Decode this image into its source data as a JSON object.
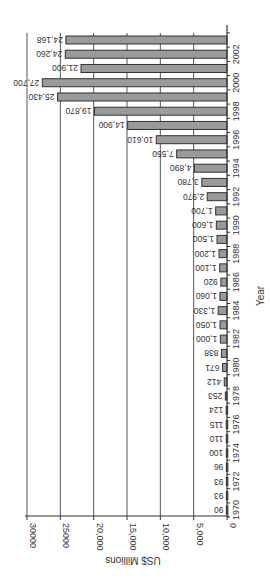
{
  "chart_data": {
    "type": "bar",
    "orientation": "rotated 90 degrees clockwise (horizontal bars growing from right, labels upside-down)",
    "title": "",
    "xlabel": "Year",
    "ylabel": "US$ Millions",
    "ylim": [
      0,
      30000
    ],
    "y_ticks": [
      "0",
      "5,000",
      "10,000",
      "15,000",
      "20,000",
      "25000",
      "30000"
    ],
    "x_tick_labels": [
      "1970",
      "1972",
      "1974",
      "1976",
      "1978",
      "1980",
      "1982",
      "1984",
      "1986",
      "1988",
      "1990",
      "1992",
      "1994",
      "1996",
      "1998",
      "2000",
      "2002"
    ],
    "grid": true,
    "legend": false,
    "categories": [
      1970,
      1971,
      1972,
      1973,
      1974,
      1975,
      1976,
      1977,
      1978,
      1979,
      1980,
      1981,
      1982,
      1983,
      1984,
      1985,
      1986,
      1987,
      1988,
      1989,
      1990,
      1991,
      1992,
      1993,
      1994,
      1995,
      1996,
      1997,
      1998,
      1999,
      2000,
      2001,
      2002,
      2003
    ],
    "values": [
      90,
      93,
      93,
      96,
      100,
      110,
      115,
      124,
      253,
      412,
      671,
      838,
      1000,
      1050,
      1330,
      1060,
      920,
      1100,
      1200,
      1500,
      1600,
      1700,
      2970,
      3780,
      4890,
      7550,
      10610,
      14900,
      19870,
      25430,
      27700,
      21900,
      24260,
      24168
    ],
    "value_labels": [
      "90",
      "93",
      "93",
      "96",
      "100",
      "110",
      "115",
      "124",
      "253",
      "412",
      "671",
      "838",
      "1,000",
      "1,050",
      "1,330",
      "1,060",
      "920",
      "1,100",
      "1,200",
      "1,500",
      "1,600",
      "1,700",
      "2,970",
      "3,780",
      "4,890",
      "7,550",
      "10,610",
      "14,900",
      "19,870",
      "25,430",
      "27,700",
      "21,900",
      "24,260",
      "24,168"
    ],
    "colors": {
      "bar_fill": "#9a9a9a",
      "bar_stroke": "#333333",
      "axis": "#333333",
      "grid": "#555555",
      "text": "#333333"
    }
  }
}
